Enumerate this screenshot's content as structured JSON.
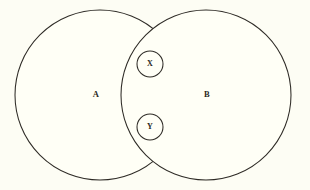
{
  "figure": {
    "type": "venn-diagram",
    "background_color": "#fdfdf4",
    "stroke_color": "#2e2b26",
    "fill_color": "#fffff6",
    "width": 310,
    "height": 190
  },
  "sets": [
    {
      "id": "A",
      "label": "A",
      "label_x": 96,
      "label_y": 95,
      "center_x": 100,
      "center_y": 95,
      "radius": 85
    },
    {
      "id": "B",
      "label": "B",
      "label_x": 207,
      "label_y": 95,
      "center_x": 206,
      "center_y": 95,
      "radius": 85
    }
  ],
  "elements": [
    {
      "id": "X",
      "label": "X",
      "center_x": 150,
      "center_y": 64,
      "radius": 13,
      "region": "intersection"
    },
    {
      "id": "Y",
      "label": "Y",
      "center_x": 150,
      "center_y": 127,
      "radius": 13,
      "region": "intersection"
    }
  ]
}
